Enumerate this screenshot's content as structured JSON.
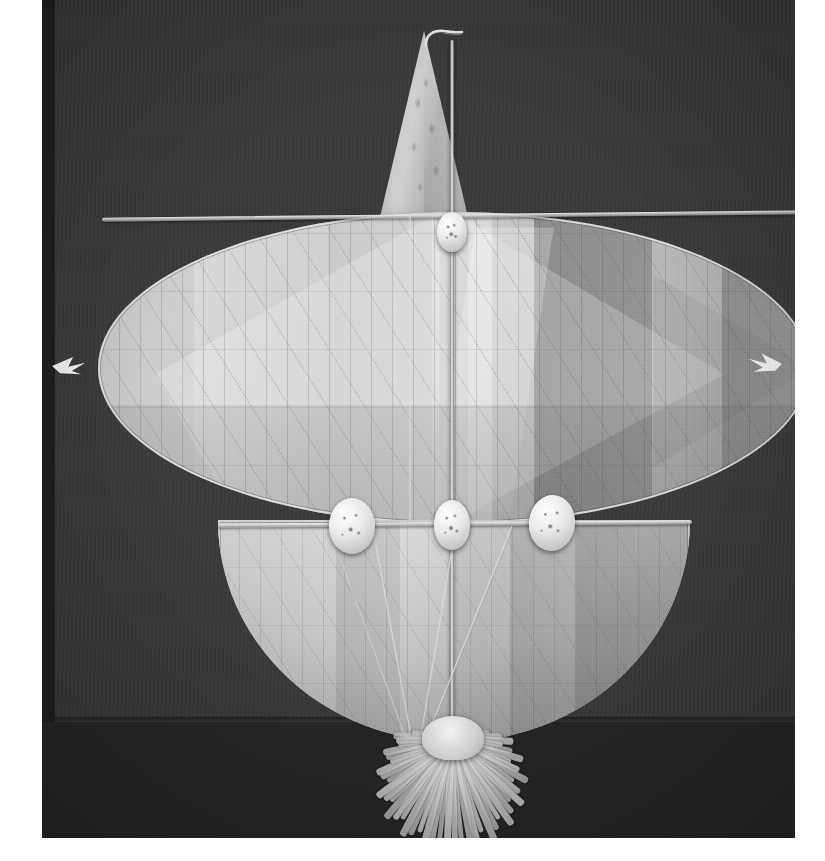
{
  "image": {
    "kind": "photograph",
    "subject": "traditional kite",
    "tone": "black-and-white",
    "orientation": "portrait",
    "width_px": 825,
    "height_px": 861
  },
  "photo": {
    "left_px": 42,
    "top_px": 0,
    "width_px": 753,
    "height_px": 838,
    "background_color": "#2b2b2b",
    "backdrop_color": "#3a3a3a",
    "floor_color": "#262626",
    "backdrop_edge_y_px": 722
  },
  "margins": {
    "left_px": 42,
    "right_px": 30,
    "bottom_px": 23,
    "color": "#ffffff"
  },
  "kite": {
    "name": "kite",
    "parts": [
      {
        "id": "top-fin",
        "label": "triangular top fin",
        "color": "#c8c8c8"
      },
      {
        "id": "fin-hook",
        "label": "hooked apex",
        "color": "#e0e0e0"
      },
      {
        "id": "upper-wing",
        "label": "lens-shaped upper wing",
        "color": "#cfcfcf"
      },
      {
        "id": "lower-sail",
        "label": "semicircular lower sail",
        "color": "#c2c2c2"
      },
      {
        "id": "spine",
        "label": "vertical spine spar",
        "color": "#e6e6e6"
      },
      {
        "id": "upper-spar",
        "label": "upper cross spar",
        "color": "#f0f0f0"
      },
      {
        "id": "mid-spar",
        "label": "middle cross spar",
        "color": "#f0f0f0"
      },
      {
        "id": "bridle",
        "label": "bridle lines",
        "color": "#dddddd"
      },
      {
        "id": "tip-tuft-left",
        "label": "left wingtip tuft",
        "color": "#f2f2f2"
      },
      {
        "id": "tip-tuft-right",
        "label": "right wingtip tuft",
        "color": "#f2f2f2"
      },
      {
        "id": "rosettes",
        "label": "paper rosette decorations",
        "color": "#ececec"
      },
      {
        "id": "tassel",
        "label": "fringed paper tassel",
        "color": "#efefef"
      }
    ],
    "upper_wing": {
      "shape": "lens / pointed ellipse",
      "left_px": 56,
      "top_px": 212,
      "width_px": 712,
      "height_px": 312,
      "left_half_tone": "light",
      "right_half_tone": "dark",
      "panel_tones": [
        "#c6c6c6",
        "#d9d9d9",
        "#c9c9c9",
        "#dedede",
        "#c8c8c8",
        "#8c8c8c",
        "#b9b9b9",
        "#8f8f8f"
      ]
    },
    "lower_sail": {
      "shape": "half ellipse",
      "left_px": 176,
      "top_px": 520,
      "width_px": 472,
      "height_px": 222,
      "panel_tones": [
        "#cacaca",
        "#bdbdbd",
        "#d6d6d6",
        "#c4c4c4",
        "#a9a9a9",
        "#9b9b9b"
      ]
    },
    "top_fin": {
      "left_px": 338,
      "top_px": 31,
      "width_px": 88,
      "height_px": 186
    },
    "tassel": {
      "left_px": 238,
      "top_px": 708,
      "width_px": 344,
      "height_px": 126,
      "strand_count": 46
    },
    "rosette_count": 4
  },
  "palette": {
    "paper_white": "#f2f2f2",
    "sail_light": "#d8d8d8",
    "sail_mid": "#b4b4b4",
    "sail_dark": "#8a8a8a",
    "backdrop": "#3a3a3a",
    "frame_dark": "#1f1f1f",
    "margin": "#ffffff"
  }
}
